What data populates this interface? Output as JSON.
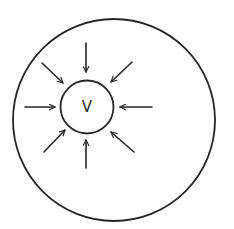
{
  "diagram": {
    "colors": {
      "stroke": "#262626",
      "background": "#ffffff"
    },
    "outer_circle": {
      "cx": 114,
      "cy": 120,
      "r": 101
    },
    "inner_circle": {
      "cx": 87,
      "cy": 107,
      "r": 26.5,
      "label": "V"
    },
    "arrows": [
      {
        "name": "arrow-top",
        "x1": 86,
        "y1": 43,
        "x2": 86,
        "y2": 72
      },
      {
        "name": "arrow-top-right",
        "x1": 132,
        "y1": 62,
        "x2": 111,
        "y2": 82
      },
      {
        "name": "arrow-right",
        "x1": 152,
        "y1": 107,
        "x2": 120,
        "y2": 107
      },
      {
        "name": "arrow-bottom-right",
        "x1": 134,
        "y1": 152,
        "x2": 111,
        "y2": 132
      },
      {
        "name": "arrow-bottom",
        "x1": 86,
        "y1": 168,
        "x2": 86,
        "y2": 140
      },
      {
        "name": "arrow-bottom-left",
        "x1": 44,
        "y1": 152,
        "x2": 65,
        "y2": 130
      },
      {
        "name": "arrow-left",
        "x1": 25,
        "y1": 107,
        "x2": 55,
        "y2": 107
      },
      {
        "name": "arrow-top-left",
        "x1": 42,
        "y1": 63,
        "x2": 63,
        "y2": 83
      }
    ]
  }
}
